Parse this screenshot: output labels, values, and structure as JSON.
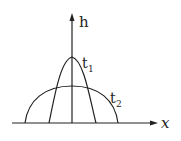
{
  "diagram": {
    "type": "wave-spreading-profiles",
    "axes": {
      "vertical_label": "h",
      "horizontal_label": "x"
    },
    "curves": [
      {
        "id": "t1",
        "label_main": "t",
        "label_sub": "1",
        "description": "narrow tall profile at earlier time"
      },
      {
        "id": "t2",
        "label_main": "t",
        "label_sub": "2",
        "description": "wide flat profile at later time"
      }
    ],
    "colors": {
      "line": "#222222",
      "background": "#ffffff"
    }
  }
}
